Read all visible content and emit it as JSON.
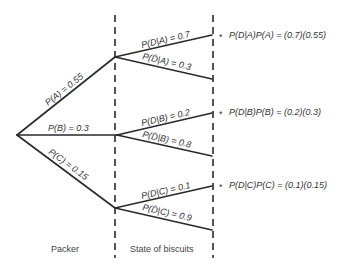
{
  "diagram": {
    "type": "probability-tree",
    "columns": {
      "packer": "Packer",
      "state": "State of biscuits"
    },
    "first_level": [
      {
        "id": "A",
        "label": "P(A) = 0.55"
      },
      {
        "id": "B",
        "label": "P(B) = 0.3"
      },
      {
        "id": "C",
        "label": "P(C) = 0.15"
      }
    ],
    "second_level": {
      "A": {
        "defective": "P(D|A) = 0.7",
        "not_defective": "P(D̄|A) = 0.3",
        "result": "P(D|A)P(A) = (0.7)(0.55)"
      },
      "B": {
        "defective": "P(D|B) = 0.2",
        "not_defective": "P(D̄|B) = 0.8",
        "result": "P(D|B)P(B) = (0.2)(0.3)"
      },
      "C": {
        "defective": "P(D|C) = 0.1",
        "not_defective": "P(D̄|C) = 0.9",
        "result": "P(D|C)P(C) = (0.1)(0.15)"
      }
    },
    "marker": "*"
  }
}
